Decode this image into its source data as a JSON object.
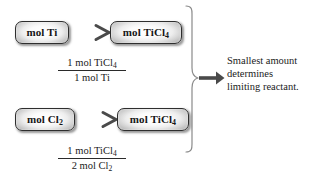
{
  "diagram": {
    "background_color": "#ffffff",
    "line_color": "#555555",
    "box_border_color": "#2e2e2e",
    "text_color": "#1b1b1b",
    "rows": [
      {
        "id": "row-1",
        "from_label": "mol Ti",
        "from_formula": {
          "text": "mol Ti",
          "base": "mol Ti",
          "sub": ""
        },
        "to_label": "mol TiCl4",
        "to_formula": {
          "base": "mol TiCl",
          "sub": "4"
        },
        "ratio": {
          "numerator": {
            "base": "1 mol TiCl",
            "sub": "4"
          },
          "denominator": {
            "base": "1 mol Ti",
            "sub": ""
          }
        }
      },
      {
        "id": "row-2",
        "from_formula": {
          "base": "mol Cl",
          "sub": "2"
        },
        "to_formula": {
          "base": "mol TiCl",
          "sub": "4"
        },
        "ratio": {
          "numerator": {
            "base": "1 mol TiCl",
            "sub": "4"
          },
          "denominator": {
            "base": "2 mol Cl",
            "sub": "2"
          }
        }
      }
    ],
    "brace": {
      "orientation": "right-pointing",
      "spans_rows": 2
    },
    "conclusion": {
      "lines": [
        "Smallest amount",
        "determines",
        "limiting reactant."
      ],
      "full_text": "Smallest amount determines limiting reactant."
    },
    "arrows": {
      "row1_arrow": "right-arrow",
      "row2_arrow": "right-arrow",
      "brace_arrow": "right-arrow"
    }
  }
}
